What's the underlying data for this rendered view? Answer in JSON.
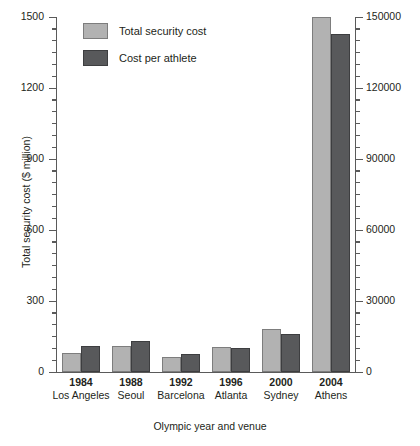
{
  "chart_data": {
    "type": "bar",
    "title": "",
    "xlabel": "Olympic year and venue",
    "ylabel": "Total security cost ($ million)",
    "ylabel_right": "Cost per athlete ($)",
    "grid": false,
    "legend_position": "top-left",
    "categories": [
      "1984",
      "1988",
      "1992",
      "1996",
      "2000",
      "2004"
    ],
    "venues": [
      "Los Angeles",
      "Seoul",
      "Barcelona",
      "Atlanta",
      "Sydney",
      "Athens"
    ],
    "ylim": [
      0,
      1500
    ],
    "ylim_right": [
      0,
      150000
    ],
    "yticks": [
      "0",
      "300",
      "600",
      "900",
      "1200",
      "1500"
    ],
    "yticks_right": [
      "0",
      "30000",
      "60000",
      "90000",
      "120000",
      "150000"
    ],
    "series": [
      {
        "name": "Total security cost",
        "color": "#b2b2b2",
        "axis": "left",
        "values": [
          80,
          110,
          65,
          105,
          180,
          1500
        ]
      },
      {
        "name": "Cost per athlete",
        "color": "#58595b",
        "axis": "right",
        "values": [
          11000,
          13000,
          7500,
          10000,
          16000,
          143000
        ]
      }
    ]
  },
  "legend": {
    "items": [
      {
        "label": "Total security cost",
        "swatch": "light"
      },
      {
        "label": "Cost per athlete",
        "swatch": "dark"
      }
    ]
  },
  "axes": {
    "left": {
      "title": "Total security cost ($ million)",
      "ticks": [
        "1500",
        "1200",
        "900",
        "600",
        "300",
        "0"
      ]
    },
    "right": {
      "title": "Cost per athlete ($)",
      "ticks": [
        "150000",
        "120000",
        "90000",
        "60000",
        "30000",
        "0"
      ]
    },
    "bottom": {
      "title": "Olympic year and venue",
      "groups": [
        {
          "year": "1984",
          "venue": "Los Angeles"
        },
        {
          "year": "1988",
          "venue": "Seoul"
        },
        {
          "year": "1992",
          "venue": "Barcelona"
        },
        {
          "year": "1996",
          "venue": "Atlanta"
        },
        {
          "year": "2000",
          "venue": "Sydney"
        },
        {
          "year": "2004",
          "venue": "Athens"
        }
      ]
    }
  }
}
